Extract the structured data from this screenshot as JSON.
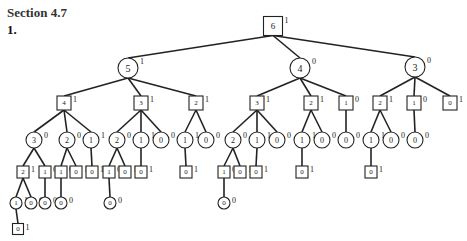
{
  "header": {
    "section": "Section 4.7",
    "problem": "1."
  },
  "tree": {
    "nodes": [
      {
        "id": "n0",
        "shape": "square",
        "value": "6",
        "label": "1",
        "x": 273,
        "y": 26,
        "size": 19
      },
      {
        "id": "n1",
        "shape": "circle",
        "value": "5",
        "label": "1",
        "x": 128,
        "y": 68,
        "r": 10
      },
      {
        "id": "n2",
        "shape": "circle",
        "value": "4",
        "label": "0",
        "x": 300,
        "y": 68,
        "r": 10
      },
      {
        "id": "n3",
        "shape": "circle",
        "value": "3",
        "label": "0",
        "x": 415,
        "y": 67,
        "r": 10
      },
      {
        "id": "n4",
        "shape": "square",
        "value": "4",
        "label": "1",
        "x": 64,
        "y": 103,
        "size": 14
      },
      {
        "id": "n5",
        "shape": "square",
        "value": "3",
        "label": "1",
        "x": 141,
        "y": 103,
        "size": 14
      },
      {
        "id": "n6",
        "shape": "square",
        "value": "2",
        "label": "1",
        "x": 196,
        "y": 103,
        "size": 14
      },
      {
        "id": "n7",
        "shape": "square",
        "value": "3",
        "label": "1",
        "x": 257,
        "y": 103,
        "size": 14
      },
      {
        "id": "n8",
        "shape": "square",
        "value": "2",
        "label": "1",
        "x": 311,
        "y": 103,
        "size": 14
      },
      {
        "id": "n9",
        "shape": "square",
        "value": "1",
        "label": "0",
        "x": 346,
        "y": 103,
        "size": 14
      },
      {
        "id": "n10",
        "shape": "square",
        "value": "2",
        "label": "1",
        "x": 380,
        "y": 103,
        "size": 14
      },
      {
        "id": "n11",
        "shape": "square",
        "value": "1",
        "label": "0",
        "x": 414,
        "y": 103,
        "size": 14
      },
      {
        "id": "n12",
        "shape": "square",
        "value": "0",
        "label": "1",
        "x": 450,
        "y": 103,
        "size": 14
      },
      {
        "id": "n13",
        "shape": "circle",
        "value": "3",
        "label": "0",
        "x": 34,
        "y": 140,
        "r": 8
      },
      {
        "id": "n14",
        "shape": "circle",
        "value": "2",
        "label": "0",
        "x": 67,
        "y": 140,
        "r": 8
      },
      {
        "id": "n15",
        "shape": "circle",
        "value": "1",
        "label": "1",
        "x": 91,
        "y": 140,
        "r": 8
      },
      {
        "id": "n16",
        "shape": "circle",
        "value": "2",
        "label": "0",
        "x": 117,
        "y": 140,
        "r": 8
      },
      {
        "id": "n17",
        "shape": "circle",
        "value": "1",
        "label": "1",
        "x": 141,
        "y": 140,
        "r": 8
      },
      {
        "id": "n18",
        "shape": "circle",
        "value": "0",
        "label": "0",
        "x": 161,
        "y": 140,
        "r": 8
      },
      {
        "id": "n19",
        "shape": "circle",
        "value": "1",
        "label": "1",
        "x": 185,
        "y": 140,
        "r": 8
      },
      {
        "id": "n20",
        "shape": "circle",
        "value": "0",
        "label": "0",
        "x": 206,
        "y": 140,
        "r": 8
      },
      {
        "id": "n21",
        "shape": "circle",
        "value": "2",
        "label": "0",
        "x": 233,
        "y": 140,
        "r": 8
      },
      {
        "id": "n22",
        "shape": "circle",
        "value": "1",
        "label": "1",
        "x": 257,
        "y": 140,
        "r": 8
      },
      {
        "id": "n23",
        "shape": "circle",
        "value": "0",
        "label": "0",
        "x": 277,
        "y": 140,
        "r": 8
      },
      {
        "id": "n24",
        "shape": "circle",
        "value": "1",
        "label": "1",
        "x": 302,
        "y": 140,
        "r": 8
      },
      {
        "id": "n25",
        "shape": "circle",
        "value": "0",
        "label": "0",
        "x": 322,
        "y": 140,
        "r": 8
      },
      {
        "id": "n26",
        "shape": "circle",
        "value": "0",
        "label": "0",
        "x": 346,
        "y": 140,
        "r": 8
      },
      {
        "id": "n27",
        "shape": "circle",
        "value": "1",
        "label": "1",
        "x": 371,
        "y": 140,
        "r": 8
      },
      {
        "id": "n28",
        "shape": "circle",
        "value": "0",
        "label": "0",
        "x": 391,
        "y": 140,
        "r": 8
      },
      {
        "id": "n29",
        "shape": "circle",
        "value": "0",
        "label": "0",
        "x": 415,
        "y": 140,
        "r": 8
      },
      {
        "id": "n30",
        "shape": "square",
        "value": "2",
        "label": "1",
        "x": 23,
        "y": 172,
        "size": 12
      },
      {
        "id": "n31",
        "shape": "square",
        "value": "1",
        "label": "0",
        "x": 45,
        "y": 172,
        "size": 12
      },
      {
        "id": "n32",
        "shape": "square",
        "value": "1",
        "label": "0",
        "x": 61,
        "y": 172,
        "size": 12
      },
      {
        "id": "n33",
        "shape": "square",
        "value": "0",
        "label": "1",
        "x": 76,
        "y": 172,
        "size": 12
      },
      {
        "id": "n34",
        "shape": "square",
        "value": "0",
        "label": "1",
        "x": 92,
        "y": 172,
        "size": 12
      },
      {
        "id": "n35",
        "shape": "square",
        "value": "1",
        "label": "0",
        "x": 109,
        "y": 172,
        "size": 12
      },
      {
        "id": "n36",
        "shape": "square",
        "value": "0",
        "label": "1",
        "x": 125,
        "y": 172,
        "size": 12
      },
      {
        "id": "n37",
        "shape": "square",
        "value": "0",
        "label": "1",
        "x": 141,
        "y": 172,
        "size": 12
      },
      {
        "id": "n38",
        "shape": "square",
        "value": "0",
        "label": "1",
        "x": 186,
        "y": 172,
        "size": 12
      },
      {
        "id": "n39",
        "shape": "square",
        "value": "1",
        "label": "0",
        "x": 224,
        "y": 172,
        "size": 12
      },
      {
        "id": "n40",
        "shape": "square",
        "value": "0",
        "label": "1",
        "x": 240,
        "y": 172,
        "size": 12
      },
      {
        "id": "n41",
        "shape": "square",
        "value": "0",
        "label": "1",
        "x": 256,
        "y": 172,
        "size": 12
      },
      {
        "id": "n42",
        "shape": "square",
        "value": "0",
        "label": "1",
        "x": 302,
        "y": 172,
        "size": 12
      },
      {
        "id": "n43",
        "shape": "square",
        "value": "0",
        "label": "1",
        "x": 371,
        "y": 172,
        "size": 12
      },
      {
        "id": "n44",
        "shape": "circle",
        "value": "1",
        "label": "1",
        "x": 16,
        "y": 203,
        "r": 6
      },
      {
        "id": "n45",
        "shape": "circle",
        "value": "0",
        "label": "0",
        "x": 31,
        "y": 203,
        "r": 6
      },
      {
        "id": "n46",
        "shape": "circle",
        "value": "0",
        "label": "0",
        "x": 45,
        "y": 203,
        "r": 6
      },
      {
        "id": "n47",
        "shape": "circle",
        "value": "0",
        "label": "0",
        "x": 61,
        "y": 203,
        "r": 6
      },
      {
        "id": "n48",
        "shape": "circle",
        "value": "0",
        "label": "0",
        "x": 110,
        "y": 203,
        "r": 6
      },
      {
        "id": "n49",
        "shape": "circle",
        "value": "0",
        "label": "0",
        "x": 224,
        "y": 203,
        "r": 6
      },
      {
        "id": "n50",
        "shape": "square",
        "value": "0",
        "label": "1",
        "x": 18,
        "y": 229,
        "size": 11
      }
    ],
    "edges": [
      [
        "n0",
        "n1"
      ],
      [
        "n0",
        "n2"
      ],
      [
        "n0",
        "n3"
      ],
      [
        "n1",
        "n4"
      ],
      [
        "n1",
        "n5"
      ],
      [
        "n1",
        "n6"
      ],
      [
        "n2",
        "n7"
      ],
      [
        "n2",
        "n8"
      ],
      [
        "n2",
        "n9"
      ],
      [
        "n3",
        "n10"
      ],
      [
        "n3",
        "n11"
      ],
      [
        "n3",
        "n12"
      ],
      [
        "n4",
        "n13"
      ],
      [
        "n4",
        "n14"
      ],
      [
        "n4",
        "n15"
      ],
      [
        "n5",
        "n16"
      ],
      [
        "n5",
        "n17"
      ],
      [
        "n5",
        "n18"
      ],
      [
        "n6",
        "n19"
      ],
      [
        "n6",
        "n20"
      ],
      [
        "n7",
        "n21"
      ],
      [
        "n7",
        "n22"
      ],
      [
        "n7",
        "n23"
      ],
      [
        "n8",
        "n24"
      ],
      [
        "n8",
        "n25"
      ],
      [
        "n9",
        "n26"
      ],
      [
        "n10",
        "n27"
      ],
      [
        "n10",
        "n28"
      ],
      [
        "n11",
        "n29"
      ],
      [
        "n13",
        "n30"
      ],
      [
        "n13",
        "n31"
      ],
      [
        "n14",
        "n32"
      ],
      [
        "n14",
        "n33"
      ],
      [
        "n15",
        "n34"
      ],
      [
        "n16",
        "n35"
      ],
      [
        "n16",
        "n36"
      ],
      [
        "n17",
        "n37"
      ],
      [
        "n19",
        "n38"
      ],
      [
        "n21",
        "n39"
      ],
      [
        "n21",
        "n40"
      ],
      [
        "n22",
        "n41"
      ],
      [
        "n24",
        "n42"
      ],
      [
        "n27",
        "n43"
      ],
      [
        "n30",
        "n44"
      ],
      [
        "n30",
        "n45"
      ],
      [
        "n31",
        "n46"
      ],
      [
        "n32",
        "n47"
      ],
      [
        "n35",
        "n48"
      ],
      [
        "n39",
        "n49"
      ],
      [
        "n44",
        "n50"
      ]
    ]
  },
  "colors": {
    "stroke": "#222222",
    "fill": "#ffffff",
    "heading": "#333333"
  }
}
